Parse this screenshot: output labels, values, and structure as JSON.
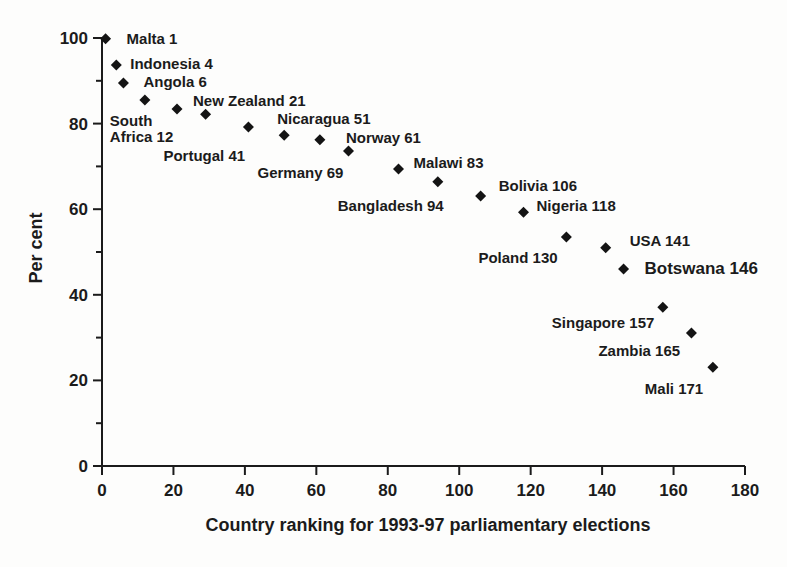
{
  "figure": {
    "background": "#fdfdfc",
    "ink": "#1b1b1b",
    "marker_color": "#141414"
  },
  "chart_data": {
    "type": "scatter",
    "title": "",
    "xlabel": "Country ranking for 1993-97 parliamentary elections",
    "ylabel": "Per cent",
    "xlim": [
      0,
      180
    ],
    "ylim": [
      0,
      100
    ],
    "x_ticks": [
      0,
      20,
      40,
      60,
      80,
      100,
      120,
      140,
      160,
      180
    ],
    "y_ticks": [
      0,
      20,
      40,
      60,
      80,
      100
    ],
    "y_minor_ticks": [
      10,
      30,
      50,
      70,
      90
    ],
    "grid": false,
    "legend": "none",
    "marker": "diamond",
    "points": [
      {
        "country": "Malta",
        "rank": 1,
        "percent": 99.8,
        "label": "Malta 1",
        "bold": false,
        "label_dx": 21,
        "label_dy": 5
      },
      {
        "country": "Indonesia",
        "rank": 4,
        "percent": 93.7,
        "label": "Indonesia 4",
        "bold": false,
        "label_dx": 14,
        "label_dy": 4
      },
      {
        "country": "Angola",
        "rank": 6,
        "percent": 89.5,
        "label": "Angola 6",
        "bold": false,
        "label_dx": 20,
        "label_dy": 4
      },
      {
        "country": "South Africa",
        "rank": 12,
        "percent": 85.5,
        "label": "South Africa 12",
        "label_lines": [
          "South",
          "Africa 12"
        ],
        "bold": false,
        "label_dx": -35,
        "label_dy": 26
      },
      {
        "country": "New Zealand",
        "rank": 21,
        "percent": 83.4,
        "label": "New Zealand 21",
        "bold": false,
        "label_dx": 16,
        "label_dy": -3
      },
      {
        "country": "",
        "rank": 29,
        "percent": 82.2,
        "label": "",
        "bold": false,
        "label_dx": 0,
        "label_dy": 0
      },
      {
        "country": "Portugal",
        "rank": 41,
        "percent": 79.2,
        "label": "Portugal 41",
        "bold": false,
        "label_dx": -85,
        "label_dy": 34
      },
      {
        "country": "Nicaragua",
        "rank": 51,
        "percent": 77.3,
        "label": "Nicaragua 51",
        "bold": false,
        "label_dx": -7,
        "label_dy": -11
      },
      {
        "country": "Norway",
        "rank": 61,
        "percent": 76.2,
        "label": "Norway 61",
        "bold": false,
        "label_dx": 26,
        "label_dy": 3
      },
      {
        "country": "Germany",
        "rank": 69,
        "percent": 73.6,
        "label": "Germany 69",
        "bold": false,
        "label_dx": -91,
        "label_dy": 27
      },
      {
        "country": "Malawi",
        "rank": 83,
        "percent": 69.4,
        "label": "Malawi 83",
        "bold": false,
        "label_dx": 15,
        "label_dy": -1
      },
      {
        "country": "Bangladesh",
        "rank": 94,
        "percent": 66.4,
        "label": "Bangladesh 94",
        "bold": false,
        "label_dx": -100,
        "label_dy": 29
      },
      {
        "country": "Bolivia",
        "rank": 106,
        "percent": 63.1,
        "label": "Bolivia 106",
        "bold": false,
        "label_dx": 18,
        "label_dy": -5
      },
      {
        "country": "Nigeria",
        "rank": 118,
        "percent": 59.3,
        "label": "Nigeria 118",
        "bold": false,
        "label_dx": 13,
        "label_dy": -1
      },
      {
        "country": "Poland",
        "rank": 130,
        "percent": 53.5,
        "label": "Poland 130",
        "bold": false,
        "label_dx": -88,
        "label_dy": 26
      },
      {
        "country": "USA",
        "rank": 141,
        "percent": 51.0,
        "label": "USA 141",
        "bold": false,
        "label_dx": 24,
        "label_dy": -2
      },
      {
        "country": "Botswana",
        "rank": 146,
        "percent": 46.0,
        "label": "Botswana 146",
        "bold": true,
        "label_dx": 21,
        "label_dy": 5
      },
      {
        "country": "Singapore",
        "rank": 157,
        "percent": 37.1,
        "label": "Singapore 157",
        "bold": false,
        "label_dx": -111,
        "label_dy": 21
      },
      {
        "country": "Zambia",
        "rank": 165,
        "percent": 31.1,
        "label": "Zambia 165",
        "bold": false,
        "label_dx": -93,
        "label_dy": 23
      },
      {
        "country": "Mali",
        "rank": 171,
        "percent": 23.1,
        "label": "Mali 171",
        "bold": false,
        "label_dx": -68,
        "label_dy": 27
      }
    ]
  }
}
